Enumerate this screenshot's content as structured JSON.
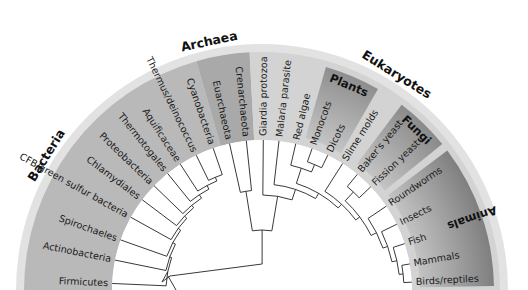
{
  "figure": {
    "type": "circular-phylogenetic-tree",
    "layout": "semicircle"
  },
  "domains": [
    {
      "name": "Bacteria",
      "label_angle": 32,
      "sector": [
        0,
        74
      ],
      "color": "#b9b9b9"
    },
    {
      "name": "Archaea",
      "label_angle": 78,
      "sector": [
        74,
        87
      ],
      "color": "#a9a9a9"
    },
    {
      "name": "Eukaryotes",
      "label_angle": 122,
      "sector": [
        87,
        180
      ],
      "color": "#d3d3d3"
    }
  ],
  "groups": [
    {
      "name": "Plants",
      "sector": [
        106,
        120
      ],
      "color_outer": "#8e8e8e",
      "color_inner": "#cfcfcf"
    },
    {
      "name": "Fungi",
      "sector": [
        127,
        141
      ],
      "color_outer": "#8a8a8a",
      "color_inner": "#cfcfcf"
    },
    {
      "name": "Animals",
      "sector": [
        143,
        179
      ],
      "color_outer": "#7f7f7f",
      "color_inner": "#d0d0d0"
    }
  ],
  "leaves": [
    {
      "label": "Firmicutes",
      "angle": 2.5,
      "domain": "Bacteria"
    },
    {
      "label": "Actinobacteria",
      "angle": 11.5,
      "domain": "Bacteria"
    },
    {
      "label": "Spirochaeles",
      "angle": 19.5,
      "domain": "Bacteria"
    },
    {
      "label": "CFB/green sulfur bacteria",
      "angle": 29,
      "domain": "Bacteria"
    },
    {
      "label": "Chlamydiales",
      "angle": 37,
      "domain": "Bacteria"
    },
    {
      "label": "Proteobacteria",
      "angle": 44,
      "domain": "Bacteria"
    },
    {
      "label": "Thermotogales",
      "angle": 51,
      "domain": "Bacteria"
    },
    {
      "label": "Aquificaceae",
      "angle": 57,
      "domain": "Bacteria"
    },
    {
      "label": "Thermus/deinococcus",
      "angle": 64,
      "domain": "Bacteria"
    },
    {
      "label": "Cyanobacteria",
      "angle": 71,
      "domain": "Bacteria"
    },
    {
      "label": "Euarchaeota",
      "angle": 77.5,
      "domain": "Archaea"
    },
    {
      "label": "Crenarchaeota",
      "angle": 84,
      "domain": "Archaea"
    },
    {
      "label": "Giardia protozoa",
      "angle": 90.5,
      "domain": "Eukaryotes"
    },
    {
      "label": "Malaria parasite",
      "angle": 96.5,
      "domain": "Eukaryotes"
    },
    {
      "label": "Red algae",
      "angle": 103,
      "domain": "Eukaryotes"
    },
    {
      "label": "Monocots",
      "angle": 109.5,
      "domain": "Eukaryotes"
    },
    {
      "label": "Dicots",
      "angle": 116,
      "domain": "Eukaryotes"
    },
    {
      "label": "Slime molds",
      "angle": 122.5,
      "domain": "Eukaryotes"
    },
    {
      "label": "Baker's yeast",
      "angle": 129.5,
      "domain": "Eukaryotes"
    },
    {
      "label": "Fission yeast",
      "angle": 136.5,
      "domain": "Eukaryotes"
    },
    {
      "label": "Roundworms",
      "angle": 146,
      "domain": "Eukaryotes"
    },
    {
      "label": "Insects",
      "angle": 154,
      "domain": "Eukaryotes"
    },
    {
      "label": "Fish",
      "angle": 162,
      "domain": "Eukaryotes"
    },
    {
      "label": "Mammals",
      "angle": 170,
      "domain": "Eukaryotes"
    },
    {
      "label": "Birds/reptiles",
      "angle": 177,
      "domain": "Eukaryotes"
    }
  ],
  "colors": {
    "background": "#ffffff",
    "outer_rim": "#e2e2e2",
    "branch": "#222222",
    "text": "#1a1a1a"
  }
}
